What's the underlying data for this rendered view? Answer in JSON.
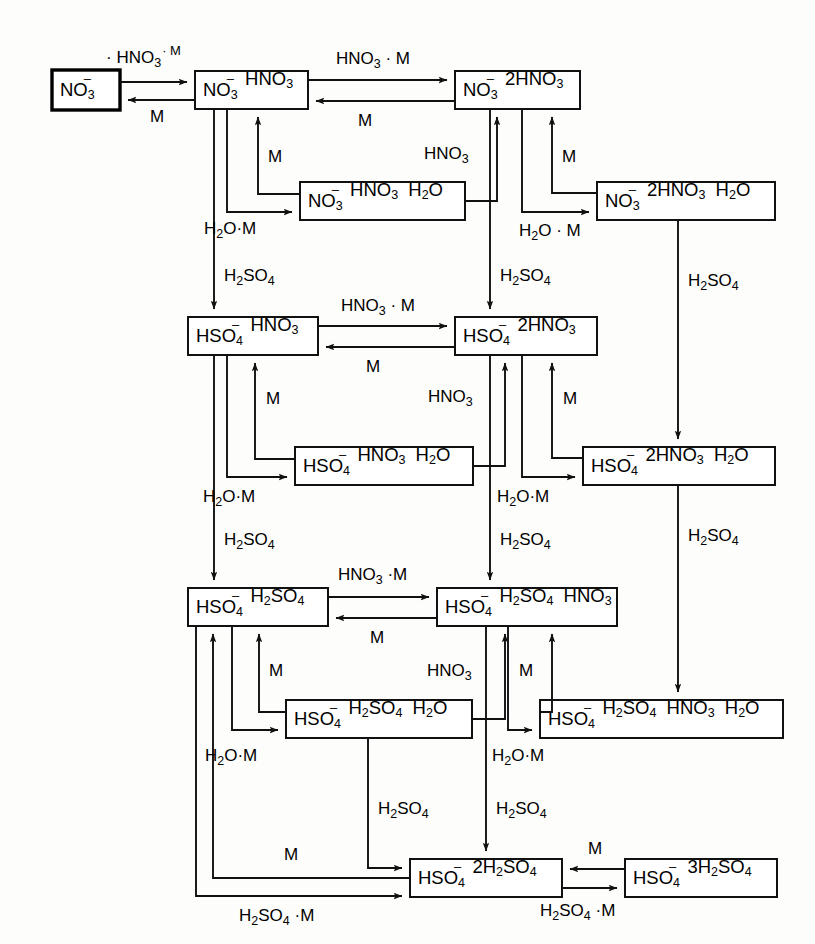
{
  "diagram": {
    "type": "reaction-network-flow-diagram",
    "line_color": "#111111",
    "box_fill": "#ffffff",
    "background": "#fdfdfc"
  },
  "boxes": [
    {
      "id": "no3",
      "label": "NO3-",
      "emphasis": "thick"
    },
    {
      "id": "no3_hno3",
      "label": "NO3- HNO3",
      "emphasis": "normal"
    },
    {
      "id": "no3_2hno3",
      "label": "NO3- 2HNO3",
      "emphasis": "normal"
    },
    {
      "id": "no3_hno3_h2o",
      "label": "NO3- HNO3 H2O",
      "emphasis": "normal"
    },
    {
      "id": "no3_2hno3_h2o",
      "label": "NO3- 2HNO3 H2O",
      "emphasis": "normal"
    },
    {
      "id": "hso4_hno3",
      "label": "HSO4- HNO3",
      "emphasis": "normal"
    },
    {
      "id": "hso4_2hno3",
      "label": "HSO4- 2HNO3",
      "emphasis": "normal"
    },
    {
      "id": "hso4_hno3_h2o",
      "label": "HSO4- HNO3 H2O",
      "emphasis": "normal"
    },
    {
      "id": "hso4_2hno3_h2o",
      "label": "HSO4- 2HNO3 H2O",
      "emphasis": "normal"
    },
    {
      "id": "hso4_h2so4",
      "label": "HSO4- H2SO4",
      "emphasis": "normal"
    },
    {
      "id": "hso4_h2so4_hno3",
      "label": "HSO4- H2SO4 HNO3",
      "emphasis": "normal"
    },
    {
      "id": "hso4_h2so4_h2o",
      "label": "HSO4- H2SO4 H2O",
      "emphasis": "normal"
    },
    {
      "id": "hso4_h2so4_hno3_h2o",
      "label": "HSO4- H2SO4 HNO3 H2O",
      "emphasis": "normal"
    },
    {
      "id": "hso4_2h2so4",
      "label": "HSO4- 2H2SO4",
      "emphasis": "normal"
    },
    {
      "id": "hso4_3h2so4",
      "label": "HSO4- 3H2SO4",
      "emphasis": "normal"
    }
  ],
  "edge_labels": [
    {
      "id": "e1",
      "label": "+ HNO3 + M",
      "from": "no3",
      "to": "no3_hno3"
    },
    {
      "id": "e2",
      "label": "M",
      "from": "no3_hno3",
      "to": "no3"
    },
    {
      "id": "e3",
      "label": "HNO3 + M",
      "from": "no3_hno3",
      "to": "no3_2hno3"
    },
    {
      "id": "e4",
      "label": "M",
      "from": "no3_2hno3",
      "to": "no3_hno3"
    },
    {
      "id": "e5",
      "label": "M",
      "from": "no3_hno3_h2o",
      "to": "no3_hno3"
    },
    {
      "id": "e6",
      "label": "H2O + M",
      "from": "no3_hno3",
      "to": "no3_hno3_h2o"
    },
    {
      "id": "e7",
      "label": "HNO3",
      "from": "no3_hno3_h2o",
      "to": "no3_2hno3"
    },
    {
      "id": "e8",
      "label": "M",
      "from": "no3_2hno3_h2o",
      "to": "no3_2hno3"
    },
    {
      "id": "e9",
      "label": "H2O + M",
      "from": "no3_2hno3",
      "to": "no3_2hno3_h2o"
    },
    {
      "id": "e10",
      "label": "H2SO4",
      "from": "no3_hno3",
      "to": "hso4_hno3"
    },
    {
      "id": "e11",
      "label": "H2SO4",
      "from": "no3_2hno3",
      "to": "hso4_2hno3"
    },
    {
      "id": "e12",
      "label": "H2SO4",
      "from": "no3_2hno3_h2o",
      "to": "hso4_2hno3_h2o"
    },
    {
      "id": "e13",
      "label": "HNO3 + M",
      "from": "hso4_hno3",
      "to": "hso4_2hno3"
    },
    {
      "id": "e14",
      "label": "M",
      "from": "hso4_2hno3",
      "to": "hso4_hno3"
    },
    {
      "id": "e15",
      "label": "M",
      "from": "hso4_hno3_h2o",
      "to": "hso4_hno3"
    },
    {
      "id": "e16",
      "label": "H2O + M",
      "from": "hso4_hno3",
      "to": "hso4_hno3_h2o"
    },
    {
      "id": "e17",
      "label": "HNO3",
      "from": "hso4_hno3_h2o",
      "to": "hso4_2hno3"
    },
    {
      "id": "e18",
      "label": "M",
      "from": "hso4_2hno3_h2o",
      "to": "hso4_2hno3"
    },
    {
      "id": "e19",
      "label": "H2O + M",
      "from": "hso4_2hno3",
      "to": "hso4_2hno3_h2o"
    },
    {
      "id": "e20",
      "label": "H2SO4",
      "from": "hso4_hno3",
      "to": "hso4_h2so4"
    },
    {
      "id": "e21",
      "label": "H2SO4",
      "from": "hso4_2hno3",
      "to": "hso4_h2so4_hno3"
    },
    {
      "id": "e22",
      "label": "H2SO4",
      "from": "hso4_2hno3_h2o",
      "to": "hso4_h2so4_hno3_h2o"
    },
    {
      "id": "e23",
      "label": "HNO3 + M",
      "from": "hso4_h2so4",
      "to": "hso4_h2so4_hno3"
    },
    {
      "id": "e24",
      "label": "M",
      "from": "hso4_h2so4_hno3",
      "to": "hso4_h2so4"
    },
    {
      "id": "e25",
      "label": "M",
      "from": "hso4_h2so4_h2o",
      "to": "hso4_h2so4"
    },
    {
      "id": "e26",
      "label": "H2O + M",
      "from": "hso4_h2so4",
      "to": "hso4_h2so4_h2o"
    },
    {
      "id": "e27",
      "label": "HNO3",
      "from": "hso4_h2so4_h2o",
      "to": "hso4_h2so4_hno3"
    },
    {
      "id": "e28",
      "label": "M",
      "from": "hso4_h2so4_hno3_h2o",
      "to": "hso4_h2so4_hno3"
    },
    {
      "id": "e29",
      "label": "H2O + M",
      "from": "hso4_h2so4_hno3",
      "to": "hso4_h2so4_hno3_h2o"
    },
    {
      "id": "e30",
      "label": "H2SO4",
      "from": "hso4_h2so4_h2o",
      "to": "hso4_2h2so4"
    },
    {
      "id": "e31",
      "label": "H2SO4",
      "from": "hso4_h2so4_hno3",
      "to": "hso4_2h2so4"
    },
    {
      "id": "e32",
      "label": "M",
      "from": "hso4_2h2so4",
      "to": "hso4_h2so4"
    },
    {
      "id": "e33",
      "label": "H2SO4 + M",
      "from": "hso4_h2so4",
      "to": "hso4_2h2so4"
    },
    {
      "id": "e34",
      "label": "M",
      "from": "hso4_3h2so4",
      "to": "hso4_2h2so4"
    },
    {
      "id": "e35",
      "label": "H2SO4 + M",
      "from": "hso4_2h2so4",
      "to": "hso4_3h2so4"
    }
  ]
}
